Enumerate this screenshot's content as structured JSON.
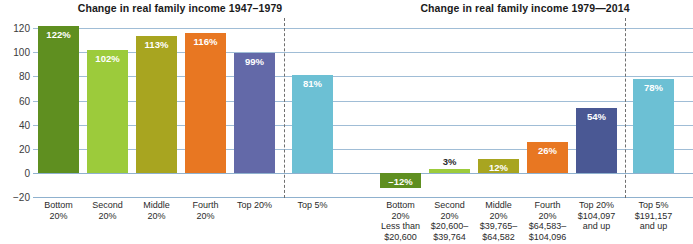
{
  "titles": {
    "left": "Change in real family income 1947–1979",
    "right": "Change in real family income 1979—2014"
  },
  "chart_data": {
    "type": "bar",
    "xlabel": "",
    "ylabel": "",
    "ylim": [
      -20,
      120
    ],
    "yticks": [
      "120",
      "100",
      "80",
      "60",
      "40",
      "20",
      "0",
      "−20"
    ],
    "ytick_values": [
      120,
      100,
      80,
      60,
      40,
      20,
      0,
      -20
    ],
    "grid": true,
    "legend": "none",
    "panels": [
      {
        "name": "1947–1979",
        "title": "Change in real family income 1947–1979",
        "categories": [
          "Bottom 20%",
          "Second 20%",
          "Middle 20%",
          "Fourth 20%",
          "Top 20%",
          "Top 5%"
        ],
        "values": [
          122,
          102,
          113,
          116,
          99,
          81
        ],
        "labels": [
          "122%",
          "102%",
          "113%",
          "116%",
          "99%",
          "81%"
        ],
        "colors": [
          "#5f8f20",
          "#9ccb3b",
          "#a8a520",
          "#e87722",
          "#6369a8",
          "#6cc0d4"
        ]
      },
      {
        "name": "1979–2014",
        "title": "Change in real family income 1979—2014",
        "categories": [
          "Bottom 20%",
          "Second 20%",
          "Middle 20%",
          "Fourth 20%",
          "Top 20%",
          "Top 5%"
        ],
        "values": [
          -12,
          3,
          12,
          26,
          54,
          78
        ],
        "labels": [
          "–12%",
          "3%",
          "12%",
          "26%",
          "54%",
          "78%"
        ],
        "colors": [
          "#5f8f20",
          "#9ccb3b",
          "#a8a520",
          "#e87722",
          "#4a5894",
          "#6cc0d4"
        ]
      }
    ]
  },
  "axis": {
    "ticks": [
      {
        "label": "120"
      },
      {
        "label": "100"
      },
      {
        "label": "80"
      },
      {
        "label": "60"
      },
      {
        "label": "40"
      },
      {
        "label": "20"
      },
      {
        "label": "0"
      },
      {
        "label": "−20"
      }
    ]
  },
  "panel_left": {
    "bars": [
      {
        "label": "122%",
        "value": 122,
        "color": "#5f8f20"
      },
      {
        "label": "102%",
        "value": 102,
        "color": "#9ccb3b"
      },
      {
        "label": "113%",
        "value": 113,
        "color": "#a8a520"
      },
      {
        "label": "116%",
        "value": 116,
        "color": "#e87722"
      },
      {
        "label": "99%",
        "value": 99,
        "color": "#6369a8"
      }
    ],
    "categories": [
      {
        "line1": "Bottom",
        "line2": "20%",
        "line3": "",
        "line4": ""
      },
      {
        "line1": "Second",
        "line2": "20%",
        "line3": "",
        "line4": ""
      },
      {
        "line1": "Middle",
        "line2": "20%",
        "line3": "",
        "line4": ""
      },
      {
        "line1": "Fourth",
        "line2": "20%",
        "line3": "",
        "line4": ""
      },
      {
        "line1": "Top 20%",
        "line2": "",
        "line3": "",
        "line4": ""
      }
    ]
  },
  "panel_mid": {
    "bars": [
      {
        "label": "81%",
        "value": 81,
        "color": "#6cc0d4"
      }
    ],
    "categories": [
      {
        "line1": "Top 5%",
        "line2": "",
        "line3": "",
        "line4": ""
      }
    ]
  },
  "panel_right": {
    "bars": [
      {
        "label": "–12%",
        "value": -12,
        "color": "#5f8f20"
      },
      {
        "label": "3%",
        "value": 3,
        "color": "#9ccb3b"
      },
      {
        "label": "12%",
        "value": 12,
        "color": "#a8a520"
      },
      {
        "label": "26%",
        "value": 26,
        "color": "#e87722"
      },
      {
        "label": "54%",
        "value": 54,
        "color": "#4a5894"
      }
    ],
    "categories": [
      {
        "line1": "Bottom",
        "line2": "20%",
        "line3": "Less than",
        "line4": "$20,600"
      },
      {
        "line1": "Second",
        "line2": "20%",
        "line3": "$20,600–",
        "line4": "$39,764"
      },
      {
        "line1": "Middle",
        "line2": "20%",
        "line3": "$39,765–",
        "line4": "$64,582"
      },
      {
        "line1": "Fourth",
        "line2": "20%",
        "line3": "$64,583–",
        "line4": "$104,096"
      },
      {
        "line1": "Top 20%",
        "line2": "$104,097",
        "line3": "and up",
        "line4": ""
      }
    ]
  },
  "panel_far": {
    "bars": [
      {
        "label": "78%",
        "value": 78,
        "color": "#6cc0d4"
      }
    ],
    "categories": [
      {
        "line1": "Top 5%",
        "line2": "$191,157",
        "line3": "and up",
        "line4": ""
      }
    ]
  },
  "style": {
    "gridline_color": "#8fb2cf",
    "divider_color": "#6f6f6f",
    "text_color": "#2b2b2b",
    "background": "#ffffff"
  }
}
